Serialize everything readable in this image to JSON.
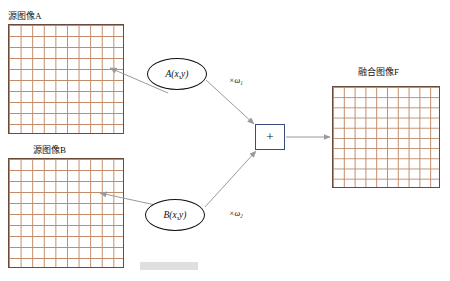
{
  "diagram": {
    "title_hidden": "",
    "nodes": {
      "source_a": {
        "label": "源图像A",
        "name": "source-image-a"
      },
      "source_b": {
        "label": "源图像B",
        "name": "source-image-b"
      },
      "fused": {
        "label": "融合图像F",
        "name": "fused-image-f"
      },
      "ellipse_a": {
        "label": "A(x,y)"
      },
      "ellipse_b": {
        "label": "B(x,y)"
      },
      "adder": {
        "label": "+"
      }
    },
    "weights": {
      "w1": "×ω₁",
      "w2": "×ω₂"
    },
    "colors": {
      "grid_line": "#c28b6a",
      "grid_border": "#6b4a3a",
      "arrow": "#9a9a9a",
      "adder_border": "#3a4a7a"
    }
  }
}
